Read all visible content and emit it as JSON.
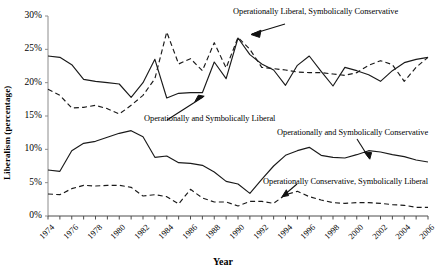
{
  "chart_data": {
    "type": "line",
    "title": "",
    "xlabel": "Year",
    "ylabel": "Liberalism (percentage)",
    "xlim": [
      1974,
      2006
    ],
    "ylim": [
      0,
      30
    ],
    "grid": false,
    "legend_position": "inline-annotations",
    "ytick_labels": [
      "0%",
      "5%",
      "10%",
      "15%",
      "20%",
      "25%",
      "30%"
    ],
    "ytick_values": [
      0,
      5,
      10,
      15,
      20,
      25,
      30
    ],
    "xtick_labels": [
      "1974",
      "1976",
      "1978",
      "1980",
      "1982",
      "1984",
      "1986",
      "1988",
      "1990",
      "1992",
      "1994",
      "1996",
      "1998",
      "2000",
      "2002",
      "2004",
      "2006"
    ],
    "x": [
      1974,
      1975,
      1976,
      1977,
      1978,
      1979,
      1980,
      1981,
      1982,
      1983,
      1984,
      1985,
      1986,
      1987,
      1988,
      1989,
      1990,
      1991,
      1992,
      1993,
      1994,
      1995,
      1996,
      1997,
      1998,
      1999,
      2000,
      2001,
      2002,
      2003,
      2004,
      2005,
      2006
    ],
    "series": [
      {
        "name": "Operationally Liberal, Symbolically Conservative",
        "style": "dashed",
        "color": "#1a1a1a",
        "values": [
          19.0,
          18.1,
          16.2,
          16.3,
          16.6,
          16.1,
          15.3,
          16.6,
          18.1,
          20.6,
          27.6,
          22.8,
          23.6,
          21.8,
          26.0,
          22.2,
          26.8,
          25.0,
          22.3,
          22.1,
          21.9,
          21.6,
          21.5,
          21.5,
          21.3,
          21.1,
          21.5,
          22.6,
          23.3,
          22.7,
          20.2,
          22.3,
          23.8
        ]
      },
      {
        "name": "Operationally and Symbolically Liberal",
        "style": "solid",
        "color": "#1a1a1a",
        "values": [
          24.0,
          23.8,
          22.7,
          20.5,
          20.2,
          20.0,
          19.8,
          17.8,
          20.0,
          23.5,
          17.7,
          18.4,
          18.5,
          18.5,
          23.1,
          20.6,
          26.7,
          24.2,
          22.8,
          21.9,
          19.6,
          22.6,
          24.0,
          21.7,
          19.5,
          22.3,
          21.8,
          21.2,
          20.2,
          21.8,
          23.0,
          23.5,
          23.8
        ]
      },
      {
        "name": "Operationally and Symbolically Conservative",
        "style": "solid",
        "color": "#1a1a1a",
        "values": [
          6.9,
          6.7,
          9.8,
          10.9,
          11.2,
          11.8,
          12.4,
          12.8,
          11.9,
          8.8,
          9.0,
          8.0,
          7.9,
          7.6,
          6.6,
          5.2,
          4.8,
          3.4,
          5.5,
          7.5,
          9.1,
          9.8,
          10.3,
          9.1,
          8.8,
          8.7,
          9.2,
          9.8,
          9.6,
          9.2,
          8.9,
          8.4,
          8.1
        ]
      },
      {
        "name": "Operationally Conservative, Symbolically Liberal",
        "style": "dashed",
        "color": "#1a1a1a",
        "values": [
          3.3,
          3.2,
          4.1,
          4.6,
          4.5,
          4.6,
          4.6,
          4.3,
          3.0,
          3.2,
          2.9,
          1.8,
          4.0,
          2.7,
          2.1,
          2.1,
          1.5,
          2.2,
          2.2,
          1.9,
          3.2,
          3.7,
          2.9,
          2.4,
          2.0,
          1.9,
          2.0,
          2.0,
          1.9,
          1.7,
          1.6,
          1.3,
          1.3
        ]
      }
    ],
    "annotations": [
      {
        "id": "annot-op-lib-sym-con",
        "text": "Operationally Liberal, Symbolically Conservative"
      },
      {
        "id": "annot-op-sym-lib",
        "text": "Operationally and Symbolically Liberal"
      },
      {
        "id": "annot-op-sym-con",
        "text": "Operationally and Symbolically Conservative"
      },
      {
        "id": "annot-op-con-sym-lib",
        "text": "Operationally Conservative, Symbolically Liberal"
      }
    ]
  }
}
